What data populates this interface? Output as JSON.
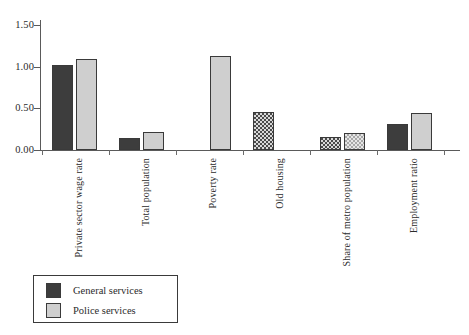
{
  "chart_data": {
    "type": "bar",
    "title": "",
    "subtitle": "",
    "xlabel": "",
    "ylabel": "",
    "ylim": [
      0.0,
      1.5
    ],
    "yticks": [
      "0.00",
      "0.50",
      "1.00",
      "1.50"
    ],
    "ytick_values": [
      0.0,
      0.5,
      1.0,
      1.5
    ],
    "grid": false,
    "legend_position": "bottom-left",
    "categories": [
      "Private sector wage rate",
      "Total population",
      "Poverty rate",
      "Old housing",
      "Share of metro population",
      "Employment ratio"
    ],
    "series": [
      {
        "name": "General services",
        "color": "#3d3d3d",
        "values": [
          1.02,
          0.15,
          0.0,
          0.46,
          0.16,
          0.31
        ]
      },
      {
        "name": "Police services",
        "color": "#cfcfcf",
        "values": [
          1.09,
          0.22,
          1.13,
          0.0,
          0.2,
          0.44
        ]
      }
    ]
  },
  "axis": {
    "y_ticks": [
      {
        "label": "1.50",
        "value": 1.5
      },
      {
        "label": "1.00",
        "value": 1.0
      },
      {
        "label": "0.50",
        "value": 0.5
      },
      {
        "label": "0.00",
        "value": 0.0
      }
    ]
  },
  "legend": {
    "items": [
      {
        "label": "General services",
        "swatch": "dark"
      },
      {
        "label": "Police services",
        "swatch": "light"
      }
    ]
  }
}
